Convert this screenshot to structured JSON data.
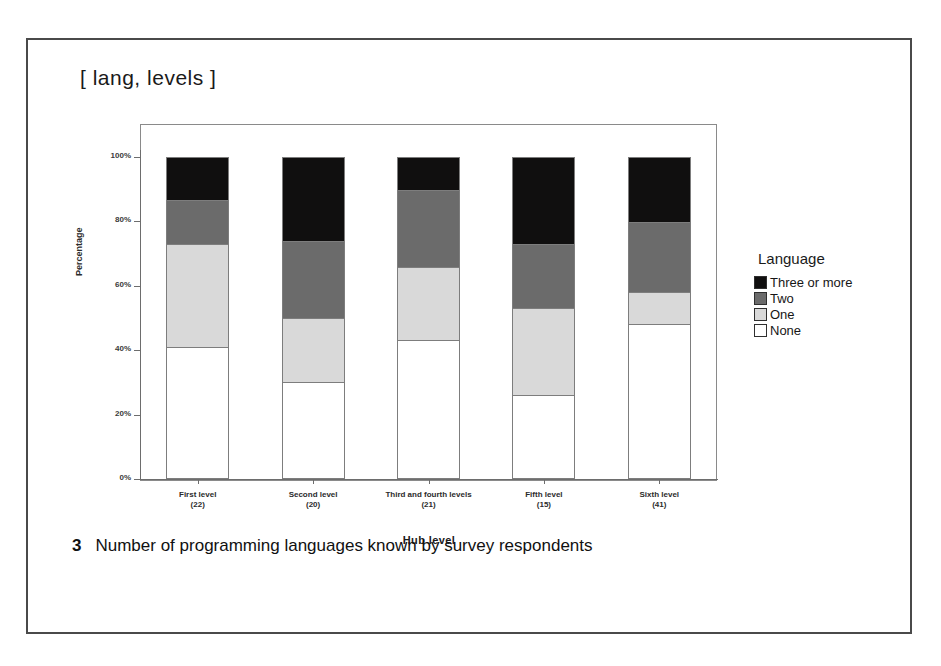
{
  "figure": {
    "title": "[ lang, levels ]",
    "caption_number": "3",
    "caption_text": "Number of programming languages known by survey respondents"
  },
  "legend": {
    "title": "Language",
    "entries": [
      {
        "label": "Three or more",
        "color": "#100f0f"
      },
      {
        "label": "Two",
        "color": "#6b6b6b"
      },
      {
        "label": "One",
        "color": "#d9d9d9"
      },
      {
        "label": "None",
        "color": "#ffffff"
      }
    ]
  },
  "chart_data": {
    "type": "bar",
    "subtype": "stacked-percentage",
    "title": "[ lang, levels ]",
    "xlabel": "Hub level",
    "ylabel": "Percentage",
    "ylim": [
      0,
      100
    ],
    "yticks": [
      "0%",
      "20%",
      "40%",
      "60%",
      "80%",
      "100%"
    ],
    "ytick_values": [
      0,
      20,
      40,
      60,
      80,
      100
    ],
    "grid": false,
    "legend_position": "right",
    "categories": [
      "First level\n(22)",
      "Second level\n(20)",
      "Third and fourth levels\n(21)",
      "Fifth level\n(15)",
      "Sixth level\n(41)"
    ],
    "category_labels": [
      {
        "name": "First level",
        "count": "(22)"
      },
      {
        "name": "Second level",
        "count": "(20)"
      },
      {
        "name": "Third and fourth levels",
        "count": "(21)"
      },
      {
        "name": "Fifth level",
        "count": "(15)"
      },
      {
        "name": "Sixth level",
        "count": "(41)"
      }
    ],
    "series": [
      {
        "name": "Three or more",
        "color": "#100f0f",
        "values": [
          13,
          26,
          10,
          27,
          20
        ]
      },
      {
        "name": "Two",
        "color": "#6b6b6b",
        "values": [
          14,
          24,
          24,
          20,
          22
        ]
      },
      {
        "name": "One",
        "color": "#d9d9d9",
        "values": [
          32,
          20,
          23,
          27,
          10
        ]
      },
      {
        "name": "None",
        "color": "#ffffff",
        "values": [
          41,
          30,
          43,
          26,
          48
        ]
      }
    ]
  }
}
